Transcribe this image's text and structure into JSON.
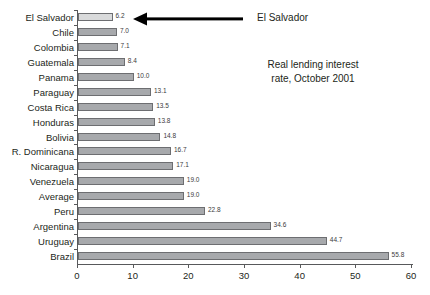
{
  "chart_data": {
    "type": "bar",
    "orientation": "horizontal",
    "title_lines": [
      "Real lending interest",
      "rate, October 2001"
    ],
    "xlabel": "",
    "ylabel": "",
    "xlim": [
      0,
      60
    ],
    "grid": false,
    "legend_position": "none",
    "xticks": [
      0,
      10,
      20,
      30,
      40,
      50,
      60
    ],
    "xtick_labels": [
      "0",
      "10",
      "20",
      "30",
      "40",
      "50",
      "60"
    ],
    "categories": [
      "El Salvador",
      "Chile",
      "Colombia",
      "Guatemala",
      "Panama",
      "Paraguay",
      "Costa Rica",
      "Honduras",
      "Bolivia",
      "R. Dominicana",
      "Nicaragua",
      "Venezuela",
      "Average",
      "Peru",
      "Argentina",
      "Uruguay",
      "Brazil"
    ],
    "values": [
      6.2,
      7.0,
      7.1,
      8.4,
      10.0,
      13.1,
      13.5,
      13.8,
      14.8,
      16.7,
      17.1,
      19.0,
      19.0,
      22.8,
      34.6,
      44.7,
      55.8
    ],
    "value_labels": [
      "6.2",
      "7.0",
      "7.1",
      "8.4",
      "10.0",
      "13.1",
      "13.5",
      "13.8",
      "14.8",
      "16.7",
      "17.1",
      "19.0",
      "19.0",
      "22.8",
      "34.6",
      "44.7",
      "55.8"
    ],
    "highlighted_category": "El Salvador",
    "colors": {
      "bar_fill": "#a7a9ac",
      "bar_fill_highlight": "#d9dadb",
      "bar_border": "#6d6e71",
      "axis": "#58595b",
      "text": "#231f20",
      "annotation": "#000000"
    }
  },
  "annotation": {
    "label": "El Salvador",
    "arrow_icon": "arrow-left-icon"
  }
}
